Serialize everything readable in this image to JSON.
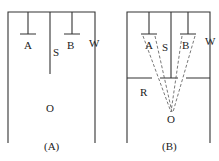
{
  "figure_a": {
    "caption": "(A)",
    "labels": {
      "a": "A",
      "s": "S",
      "b": "B",
      "w": "W",
      "o": "O"
    }
  },
  "figure_b": {
    "caption": "(B)",
    "labels": {
      "a": "A",
      "s": "S",
      "b": "B",
      "w": "W",
      "r": "R",
      "o": "O"
    }
  },
  "colors": {
    "line": "#333333",
    "text": "#222222",
    "background": "#ffffff"
  }
}
